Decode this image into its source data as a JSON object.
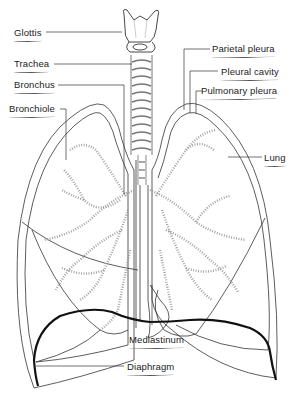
{
  "diagram": {
    "labels": [
      {
        "id": "glottis",
        "text": "Glottis",
        "x": 14,
        "y": 27
      },
      {
        "id": "trachea",
        "text": "Trachea",
        "x": 14,
        "y": 58
      },
      {
        "id": "bronchus",
        "text": "Bronchus",
        "x": 14,
        "y": 79
      },
      {
        "id": "bronchiole",
        "text": "Bronchiole",
        "x": 9,
        "y": 103
      },
      {
        "id": "parietal-pleura",
        "text": "Parietal pleura",
        "x": 212,
        "y": 43
      },
      {
        "id": "pleural-cavity",
        "text": "Pleural cavity",
        "x": 221,
        "y": 66
      },
      {
        "id": "pulmonary-pleura",
        "text": "Pulmonary pleura",
        "x": 201,
        "y": 85
      },
      {
        "id": "lung",
        "text": "Lung",
        "x": 264,
        "y": 152
      },
      {
        "id": "mediastinum",
        "text": "Mediastinum",
        "x": 129,
        "y": 334
      },
      {
        "id": "diaphragm",
        "text": "Diaphragm",
        "x": 127,
        "y": 361
      }
    ],
    "colors": {
      "line": "#333333",
      "bronchiole": "#9a9a9a",
      "diaphragm": "#111111",
      "background": "#ffffff"
    }
  }
}
